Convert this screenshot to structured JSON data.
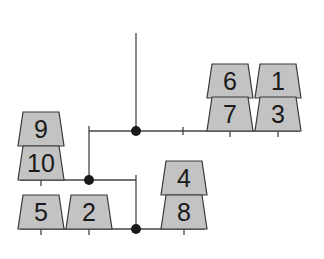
{
  "diagram": {
    "type": "mobile-balance-tree",
    "colors": {
      "block_fill": "#c3c3c3",
      "block_stroke": "#3a3a3a",
      "line": "#444444",
      "node": "#1a1a1a"
    },
    "blocks": [
      {
        "id": "b6",
        "label": "6",
        "cx": 230,
        "bottom": 98
      },
      {
        "id": "b7",
        "label": "7",
        "cx": 230,
        "bottom": 131
      },
      {
        "id": "b1",
        "label": "1",
        "cx": 278,
        "bottom": 98
      },
      {
        "id": "b3",
        "label": "3",
        "cx": 278,
        "bottom": 131
      },
      {
        "id": "b9",
        "label": "9",
        "cx": 41,
        "bottom": 146
      },
      {
        "id": "b10",
        "label": "10",
        "cx": 41,
        "bottom": 180
      },
      {
        "id": "b4",
        "label": "4",
        "cx": 184,
        "bottom": 195
      },
      {
        "id": "b8",
        "label": "8",
        "cx": 184,
        "bottom": 229
      },
      {
        "id": "b5",
        "label": "5",
        "cx": 41,
        "bottom": 229
      },
      {
        "id": "b2",
        "label": "2",
        "cx": 89,
        "bottom": 229
      }
    ]
  }
}
